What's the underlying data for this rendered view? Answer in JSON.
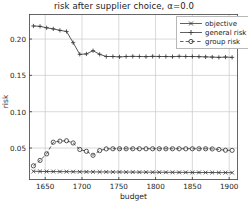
{
  "chart_data": {
    "type": "line",
    "title": "risk after supplier choice, α=0.0",
    "xlabel": "budget",
    "ylabel": "risk",
    "xlim": [
      1628,
      1912
    ],
    "ylim": [
      0.006,
      0.2345
    ],
    "xticks": [
      1650,
      1700,
      1750,
      1800,
      1850,
      1900
    ],
    "xticklabels": [
      "1650",
      "1700",
      "1750",
      "1800",
      "1850",
      "1900"
    ],
    "yticks": [
      0.05,
      0.1,
      0.15,
      0.2
    ],
    "yticklabels": [
      "0.05",
      "0.10",
      "0.15",
      "0.20"
    ],
    "grid": true,
    "legend_position": "upper right",
    "line_color": "#3a3a3a",
    "grid_color": "#c9c9c9",
    "x": [
      1634,
      1643,
      1652,
      1661,
      1670,
      1679,
      1688,
      1697,
      1706,
      1715,
      1724,
      1733,
      1742,
      1751,
      1760,
      1769,
      1778,
      1787,
      1796,
      1805,
      1814,
      1823,
      1832,
      1841,
      1850,
      1859,
      1868,
      1877,
      1886,
      1895,
      1904
    ],
    "series": [
      {
        "name": "objective",
        "marker": "x",
        "values": [
          0.018,
          0.0178,
          0.0177,
          0.0176,
          0.0175,
          0.0175,
          0.0174,
          0.0173,
          0.0172,
          0.0172,
          0.0171,
          0.0171,
          0.017,
          0.017,
          0.0169,
          0.0169,
          0.0168,
          0.0168,
          0.0167,
          0.0167,
          0.0166,
          0.0166,
          0.0165,
          0.0165,
          0.0164,
          0.0164,
          0.0163,
          0.0163,
          0.0162,
          0.0162,
          0.0161
        ]
      },
      {
        "name": "general risk",
        "marker": "+",
        "values": [
          0.218,
          0.2175,
          0.2155,
          0.214,
          0.212,
          0.2105,
          0.195,
          0.179,
          0.1795,
          0.184,
          0.179,
          0.176,
          0.176,
          0.1755,
          0.176,
          0.1762,
          0.176,
          0.1758,
          0.1762,
          0.176,
          0.176,
          0.1758,
          0.1762,
          0.176,
          0.176,
          0.1758,
          0.1755,
          0.1752,
          0.1748,
          0.1752,
          0.1748
        ]
      },
      {
        "name": "group risk",
        "marker": "o",
        "values": [
          0.0255,
          0.033,
          0.042,
          0.058,
          0.0595,
          0.06,
          0.057,
          0.048,
          0.0455,
          0.04,
          0.0465,
          0.0488,
          0.049,
          0.049,
          0.049,
          0.049,
          0.049,
          0.049,
          0.049,
          0.049,
          0.049,
          0.049,
          0.049,
          0.049,
          0.049,
          0.049,
          0.049,
          0.0488,
          0.048,
          0.047,
          0.0468
        ]
      }
    ]
  },
  "legend": {
    "items": [
      {
        "label": "objective"
      },
      {
        "label": "general risk"
      },
      {
        "label": "group risk"
      }
    ]
  }
}
